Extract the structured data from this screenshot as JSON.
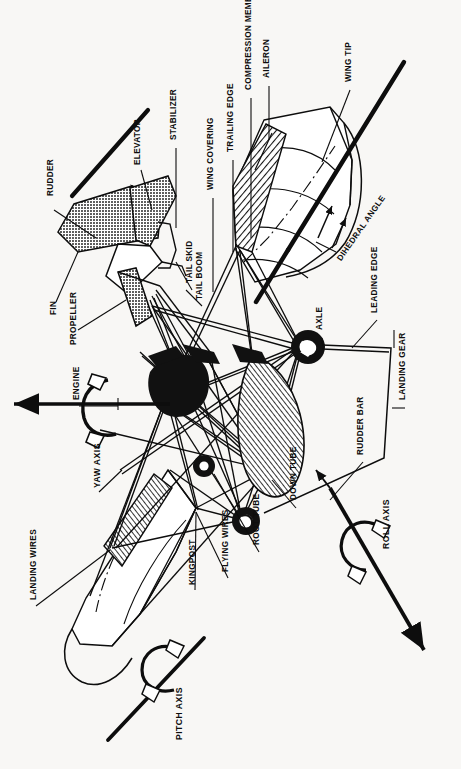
{
  "diagram": {
    "background_color": "#f8f7f5",
    "ink_color": "#0d0d0d",
    "orientation": "labels rotated 90 degrees counter-clockwise",
    "labels": [
      {
        "id": "rudder",
        "text": "RUDDER",
        "x": 47,
        "y": 196,
        "bold": false
      },
      {
        "id": "fin",
        "text": "FIN",
        "x": 50,
        "y": 315,
        "bold": false
      },
      {
        "id": "propeller",
        "text": "PROPELLER",
        "x": 70,
        "y": 345,
        "bold": false
      },
      {
        "id": "elevator",
        "text": "ELEVATOR",
        "x": 134,
        "y": 165,
        "bold": false
      },
      {
        "id": "stabilizer",
        "text": "STABILIZER",
        "x": 170,
        "y": 140,
        "bold": false
      },
      {
        "id": "tail-skid",
        "text": "TAIL SKID",
        "x": 186,
        "y": 283,
        "bold": false
      },
      {
        "id": "tail-boom",
        "text": "TAIL BOOM",
        "x": 196,
        "y": 300,
        "bold": false
      },
      {
        "id": "wing-covering",
        "text": "WING COVERING",
        "x": 207,
        "y": 190,
        "bold": false
      },
      {
        "id": "trailing-edge",
        "text": "TRAILING EDGE",
        "x": 227,
        "y": 152,
        "bold": false
      },
      {
        "id": "compression-member",
        "text": "COMPRESSION MEMBER",
        "x": 245,
        "y": 90,
        "bold": false
      },
      {
        "id": "aileron",
        "text": "AILERON",
        "x": 263,
        "y": 78,
        "bold": false
      },
      {
        "id": "wing-tip",
        "text": "WING TIP",
        "x": 345,
        "y": 82,
        "bold": false
      },
      {
        "id": "dihedral-angle",
        "text": "DIHEDRAL ANGLE",
        "x": 336,
        "y": 258,
        "bold": false,
        "rot": -55
      },
      {
        "id": "leading-edge",
        "text": "LEADING EDGE",
        "x": 371,
        "y": 313,
        "bold": false
      },
      {
        "id": "landing-gear",
        "text": "LANDING GEAR",
        "x": 399,
        "y": 400,
        "bold": false
      },
      {
        "id": "axle",
        "text": "AXLE",
        "x": 316,
        "y": 330,
        "bold": false
      },
      {
        "id": "rudder-bar",
        "text": "RUDDER BAR",
        "x": 357,
        "y": 455,
        "bold": false
      },
      {
        "id": "engine",
        "text": "ENGINE",
        "x": 73,
        "y": 400,
        "bold": false
      },
      {
        "id": "yaw-axis",
        "text": "YAW AXIS",
        "x": 93,
        "y": 488,
        "bold": true
      },
      {
        "id": "roll-axis",
        "text": "ROLL AXIS",
        "x": 382,
        "y": 549,
        "bold": true
      },
      {
        "id": "down-tube",
        "text": "DOWN TUBE",
        "x": 290,
        "y": 500,
        "bold": false
      },
      {
        "id": "root-tube",
        "text": "ROOT TUBE",
        "x": 253,
        "y": 545,
        "bold": false
      },
      {
        "id": "flying-wires",
        "text": "FLYING WIRES",
        "x": 222,
        "y": 572,
        "bold": false
      },
      {
        "id": "kingpost",
        "text": "KINGPOST",
        "x": 189,
        "y": 585,
        "bold": false
      },
      {
        "id": "landing-wires",
        "text": "LANDING WIRES",
        "x": 30,
        "y": 600,
        "bold": false
      },
      {
        "id": "pitch-axis",
        "text": "PITCH AXIS",
        "x": 175,
        "y": 740,
        "bold": true
      }
    ],
    "axes": [
      {
        "id": "yaw",
        "name": "YAW AXIS",
        "style": "straight arrow with rotation curl"
      },
      {
        "id": "roll",
        "name": "ROLL AXIS",
        "style": "diagonal arrow with rotation curl"
      },
      {
        "id": "pitch",
        "name": "PITCH AXIS",
        "style": "diagonal line with rotation curl"
      }
    ],
    "parts_count": 26
  }
}
